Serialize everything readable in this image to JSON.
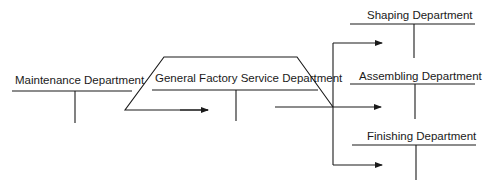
{
  "diagram": {
    "type": "cost-allocation-flow",
    "colors": {
      "line": "#1a1a1a",
      "text": "#1a1a1a",
      "background": "#ffffff"
    },
    "departments": [
      {
        "id": "maintenance",
        "label": "Maintenance Department"
      },
      {
        "id": "general_factory",
        "label": "General Factory Service Department"
      },
      {
        "id": "shaping",
        "label": "Shaping Department"
      },
      {
        "id": "assembling",
        "label": "Assembling Department"
      },
      {
        "id": "finishing",
        "label": "Finishing Department"
      }
    ],
    "flows": [
      {
        "from": "maintenance",
        "to": "general_factory"
      },
      {
        "from": "maintenance",
        "to": "shaping"
      },
      {
        "from": "maintenance",
        "to": "assembling"
      },
      {
        "from": "maintenance",
        "to": "finishing"
      },
      {
        "from": "general_factory",
        "to": "assembling"
      }
    ]
  }
}
